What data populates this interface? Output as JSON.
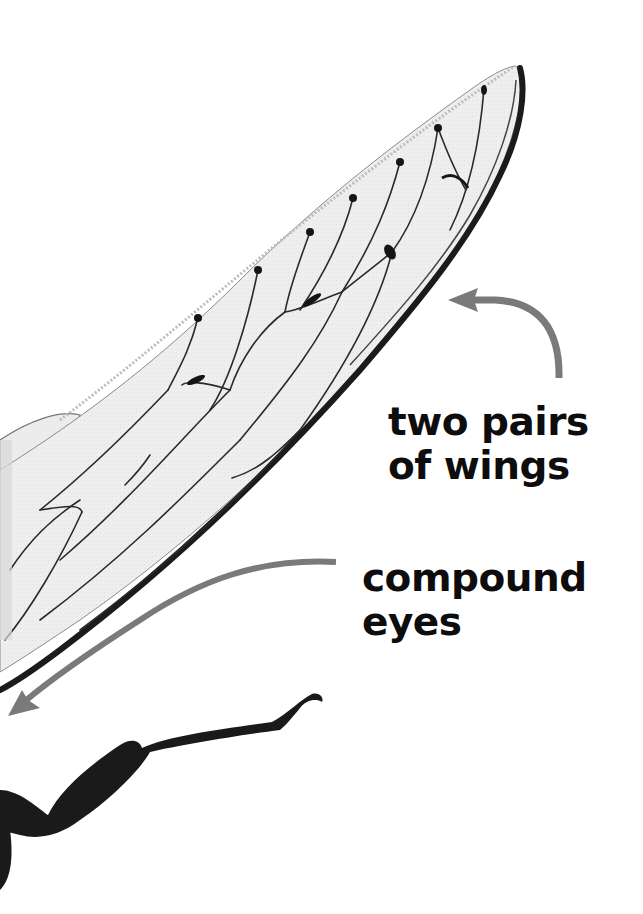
{
  "image": {
    "description": "Close-up photograph of a cicada wing and leg with callout labels",
    "background_color": "#ffffff",
    "arrow_color": "#7a7a7a",
    "label_color": "#0d0d0d"
  },
  "labels": {
    "wings": {
      "lines": [
        "two pairs",
        "of wings"
      ]
    },
    "eyes": {
      "lines": [
        "compound",
        "eyes"
      ]
    }
  },
  "icons": {
    "wings_arrow": "curved-arrow-pointing-left-to-wing",
    "eyes_arrow": "curved-arrow-pointing-down-left-to-eyes"
  }
}
